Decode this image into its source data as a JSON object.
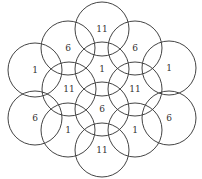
{
  "diagram": {
    "type": "overlapping-circles",
    "stroke_color": "#444444",
    "text_color": "#333333",
    "radius": 27,
    "circles": [
      {
        "label": "11",
        "cx": 102,
        "cy": 29
      },
      {
        "label": "6",
        "cx": 68,
        "cy": 48
      },
      {
        "label": "6",
        "cx": 135,
        "cy": 48
      },
      {
        "label": "1",
        "cx": 35,
        "cy": 70
      },
      {
        "label": "1",
        "cx": 102,
        "cy": 69
      },
      {
        "label": "1",
        "cx": 169,
        "cy": 68
      },
      {
        "label": "11",
        "cx": 69,
        "cy": 89
      },
      {
        "label": "11",
        "cx": 135,
        "cy": 89
      },
      {
        "label": "6",
        "cx": 35,
        "cy": 118
      },
      {
        "label": "6",
        "cx": 102,
        "cy": 109
      },
      {
        "label": "6",
        "cx": 169,
        "cy": 118
      },
      {
        "label": "1",
        "cx": 68,
        "cy": 130
      },
      {
        "label": "1",
        "cx": 135,
        "cy": 130
      },
      {
        "label": "11",
        "cx": 102,
        "cy": 150
      }
    ]
  }
}
